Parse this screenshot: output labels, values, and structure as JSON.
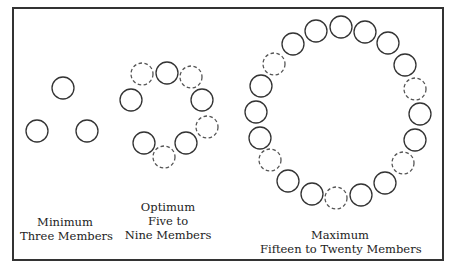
{
  "diagram": {
    "colors": {
      "stroke": "#333333",
      "dashed_stroke": "#555555",
      "background": "#ffffff"
    },
    "circle_radius": 11,
    "groups": [
      {
        "id": "minimum",
        "label_line1": "Minimum",
        "label_line2": "Three Members",
        "circles": [
          {
            "x": 63,
            "y": 88,
            "style": "solid"
          },
          {
            "x": 37,
            "y": 131,
            "style": "solid"
          },
          {
            "x": 87,
            "y": 131,
            "style": "solid"
          }
        ]
      },
      {
        "id": "optimum",
        "label_line1": "Optimum",
        "label_line2": "Five to",
        "label_line3": "Nine Members",
        "circles": [
          {
            "x": 167,
            "y": 73,
            "style": "solid"
          },
          {
            "x": 131,
            "y": 100,
            "style": "solid"
          },
          {
            "x": 202,
            "y": 100,
            "style": "solid"
          },
          {
            "x": 144,
            "y": 143,
            "style": "solid"
          },
          {
            "x": 186,
            "y": 143,
            "style": "solid"
          },
          {
            "x": 142,
            "y": 74,
            "style": "dashed"
          },
          {
            "x": 191,
            "y": 77,
            "style": "dashed"
          },
          {
            "x": 207,
            "y": 127,
            "style": "dashed"
          },
          {
            "x": 164,
            "y": 157,
            "style": "dashed"
          }
        ]
      },
      {
        "id": "maximum",
        "label_line1": "Maximum",
        "label_line2": "Fifteen to Twenty Members",
        "circles": [
          {
            "x": 293,
            "y": 44,
            "style": "solid"
          },
          {
            "x": 316,
            "y": 31,
            "style": "solid"
          },
          {
            "x": 341,
            "y": 27,
            "style": "solid"
          },
          {
            "x": 365,
            "y": 32,
            "style": "solid"
          },
          {
            "x": 388,
            "y": 43,
            "style": "solid"
          },
          {
            "x": 405,
            "y": 65,
            "style": "solid"
          },
          {
            "x": 415,
            "y": 89,
            "style": "dashed"
          },
          {
            "x": 420,
            "y": 114,
            "style": "solid"
          },
          {
            "x": 415,
            "y": 140,
            "style": "solid"
          },
          {
            "x": 403,
            "y": 163,
            "style": "dashed"
          },
          {
            "x": 385,
            "y": 183,
            "style": "solid"
          },
          {
            "x": 361,
            "y": 195,
            "style": "solid"
          },
          {
            "x": 336,
            "y": 198,
            "style": "dashed"
          },
          {
            "x": 312,
            "y": 194,
            "style": "solid"
          },
          {
            "x": 288,
            "y": 181,
            "style": "solid"
          },
          {
            "x": 270,
            "y": 160,
            "style": "dashed"
          },
          {
            "x": 260,
            "y": 138,
            "style": "solid"
          },
          {
            "x": 256,
            "y": 112,
            "style": "solid"
          },
          {
            "x": 261,
            "y": 86,
            "style": "solid"
          },
          {
            "x": 274,
            "y": 64,
            "style": "dashed"
          }
        ]
      }
    ]
  }
}
